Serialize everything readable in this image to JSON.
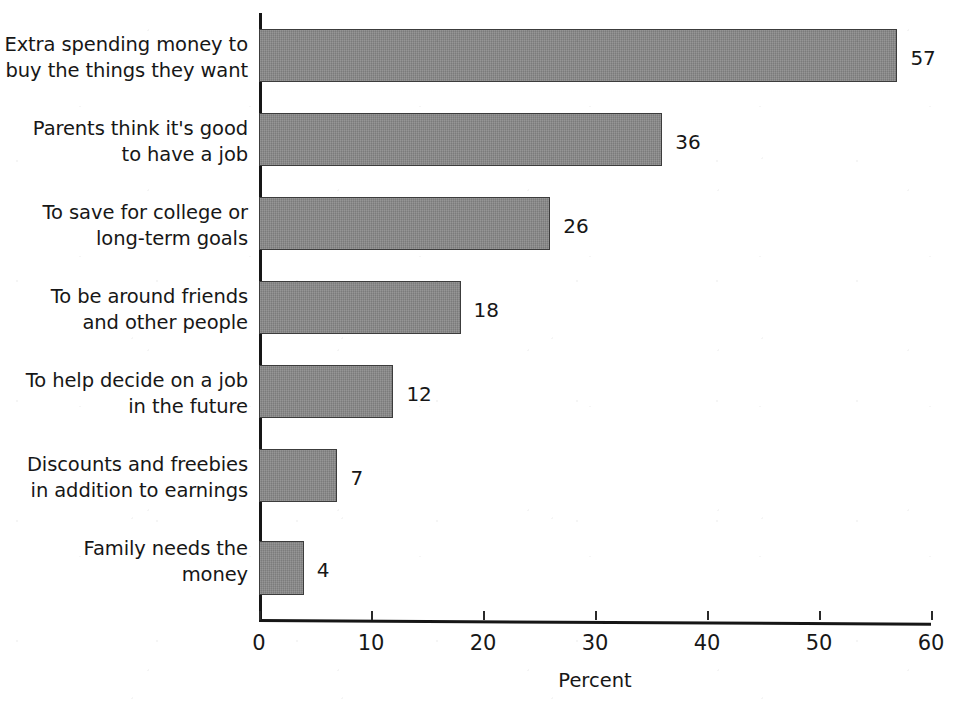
{
  "chart_data": {
    "type": "bar",
    "orientation": "horizontal",
    "title": "",
    "xlabel": "Percent",
    "ylabel": "",
    "xlim": [
      0,
      60
    ],
    "xticks": [
      0,
      10,
      20,
      30,
      40,
      50,
      60
    ],
    "xtick_labels": [
      "0",
      "10",
      "20",
      "30",
      "40",
      "50",
      "60"
    ],
    "grid": false,
    "legend": null,
    "bar_color": "#878787",
    "bar_edge_color": "#3c3c3c",
    "text_color": "#171717",
    "background": "#ffffff",
    "categories": [
      "Extra spending money to\nbuy the things they want",
      "Parents think it's good\nto have a job",
      "To save for college or\nlong-term goals",
      "To be around friends\nand other people",
      "To help decide on a job\nin the future",
      "Discounts and freebies\nin addition to earnings",
      "Family needs the\nmoney"
    ],
    "values": [
      57,
      36,
      26,
      18,
      12,
      7,
      4
    ],
    "value_labels": [
      "57",
      "36",
      "26",
      "18",
      "12",
      "7",
      "4"
    ]
  },
  "axis": {
    "x_title": "Percent"
  }
}
